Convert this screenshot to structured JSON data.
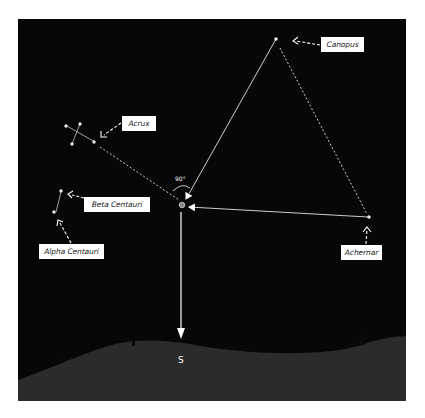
{
  "diagram": {
    "colors": {
      "sky": "#070707",
      "ground": "#2b2b2b",
      "lines": "#ffffff",
      "label_bg": "#ffffff",
      "label_text": "#222222"
    },
    "stars": [
      {
        "name": "Canopus",
        "label": "Canopus"
      },
      {
        "name": "Acrux",
        "label": "Acrux"
      },
      {
        "name": "Beta Centauri",
        "label": "Beta Centauri"
      },
      {
        "name": "Alpha Centauri",
        "label": "Alpha Centauri"
      },
      {
        "name": "Achernar",
        "label": "Achernar"
      }
    ],
    "angle_label": "90°",
    "direction_label": "S"
  }
}
